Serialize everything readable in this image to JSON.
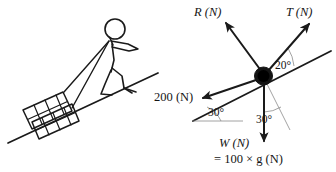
{
  "figure": {
    "background_color": "#ffffff",
    "ink_color": "#1a1a1a",
    "guide_color": "#8a8a8a"
  },
  "scene": {
    "label": "Person pulling a loaded sledge up an incline",
    "incline_angle": "30°",
    "sledge_label": "loaded-sledge",
    "person_label": "stick-figure-person",
    "rope_label": "rope"
  },
  "force_diagram": {
    "node_label": "particle-node",
    "incline_label": "incline-surface",
    "forces": [
      {
        "name": "reaction",
        "label": "R (N)",
        "symbol": "R",
        "unit": "(N)",
        "direction": "up-left-normal"
      },
      {
        "name": "tension",
        "label": "T (N)",
        "symbol": "T",
        "unit": "(N)",
        "direction": "up-slope"
      },
      {
        "name": "resistance",
        "label": "200 (N)",
        "value": "200",
        "unit": "(N)",
        "direction": "down-slope"
      },
      {
        "name": "weight",
        "label": "W (N)",
        "symbol": "W",
        "unit": "(N)",
        "direction": "vertical-down"
      }
    ],
    "weight_expression": "= 100 × g (N)",
    "angles": [
      {
        "name": "tension-to-incline",
        "value": "20°"
      },
      {
        "name": "incline-to-horizontal",
        "value": "30°"
      },
      {
        "name": "weight-to-normal",
        "value": "30°"
      }
    ]
  },
  "labels": {
    "R": "R (N)",
    "T": "T (N)",
    "force_200": "200 (N)",
    "W": "W (N)",
    "W_expression": "= 100 × g (N)",
    "angle_20": "20°",
    "angle_30_incline": "30°",
    "angle_30_weight": "30°"
  }
}
